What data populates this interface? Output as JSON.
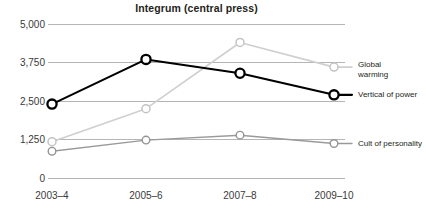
{
  "chart_data": {
    "type": "line",
    "title": "Integrum (central press)",
    "xlabel": "",
    "ylabel": "",
    "categories": [
      "2003–4",
      "2005–6",
      "2007–8",
      "2009–10"
    ],
    "ylim": [
      0,
      5000
    ],
    "yticks": [
      0,
      1250,
      2500,
      3750,
      5000
    ],
    "ytick_labels": [
      "0",
      "1,250",
      "2,500",
      "3,750",
      "5,000"
    ],
    "grid": true,
    "legend_position": "right-inline-labels",
    "series": [
      {
        "name": "Vertical of power",
        "label": "Vertical of power",
        "color": "#000000",
        "line_width": 2.1,
        "marker": "open-circle",
        "values": [
          2400,
          3850,
          3400,
          2700
        ]
      },
      {
        "name": "Global warming",
        "label": "Global\nwarming",
        "color": "#cfcfcf",
        "line_width": 1.5,
        "marker": "open-circle",
        "values": [
          1180,
          2250,
          4400,
          3600
        ]
      },
      {
        "name": "Cult of personality",
        "label": "Cult of personality",
        "color": "#a0a0a0",
        "line_width": 1.3,
        "marker": "open-circle",
        "values": [
          870,
          1230,
          1390,
          1120
        ]
      }
    ]
  },
  "style": {
    "grid_color": "#b5b5b5",
    "axis_text_color": "#3a3a3a",
    "background": "#ffffff"
  }
}
